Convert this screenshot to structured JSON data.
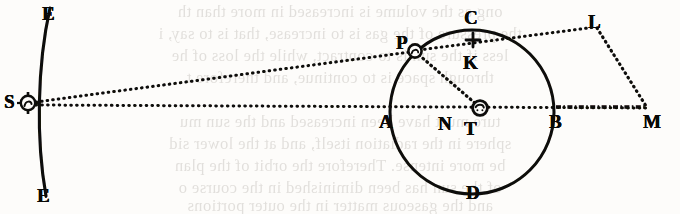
{
  "figure": {
    "kind": "geometric-astronomical-diagram",
    "caption_text": "",
    "ink_color": "#0a0907",
    "paper_color": "#fdfcfa",
    "ghost_color": "#5f564c",
    "labels": [
      {
        "id": "E-top",
        "text": "E",
        "x": 42,
        "y": 4,
        "name": "point-label-e-top"
      },
      {
        "id": "E-bot",
        "text": "E",
        "x": 37,
        "y": 186,
        "name": "point-label-e-bottom"
      },
      {
        "id": "S",
        "text": "S",
        "x": 4,
        "y": 92,
        "name": "point-label-s"
      },
      {
        "id": "P",
        "text": "P",
        "x": 396,
        "y": 33,
        "name": "point-label-p"
      },
      {
        "id": "C",
        "text": "C",
        "x": 464,
        "y": 8,
        "name": "point-label-c"
      },
      {
        "id": "K",
        "text": "K",
        "x": 463,
        "y": 53,
        "name": "point-label-k"
      },
      {
        "id": "L",
        "text": "L",
        "x": 588,
        "y": 12,
        "name": "point-label-l"
      },
      {
        "id": "A",
        "text": "A",
        "x": 379,
        "y": 112,
        "name": "point-label-a"
      },
      {
        "id": "N",
        "text": "N",
        "x": 438,
        "y": 114,
        "name": "point-label-n"
      },
      {
        "id": "T",
        "text": "T",
        "x": 464,
        "y": 119,
        "name": "point-label-t"
      },
      {
        "id": "B",
        "text": "B",
        "x": 549,
        "y": 112,
        "name": "point-label-b"
      },
      {
        "id": "D",
        "text": "D",
        "x": 466,
        "y": 183,
        "name": "point-label-d"
      },
      {
        "id": "M",
        "text": "M",
        "x": 643,
        "y": 112,
        "name": "point-label-m"
      }
    ],
    "markers": [
      {
        "id": "S-sun",
        "symbol": "sun",
        "x": 28,
        "y": 103,
        "r": 7.5,
        "name": "sun-symbol-at-s"
      },
      {
        "id": "T-earth",
        "symbol": "earth",
        "x": 480,
        "y": 108,
        "r": 7.5,
        "name": "earth-symbol-at-t"
      },
      {
        "id": "P-body",
        "symbol": "orb",
        "x": 415,
        "y": 51,
        "r": 6.5,
        "name": "planet-marker-at-p"
      },
      {
        "id": "K-cross",
        "symbol": "cross",
        "x": 473,
        "y": 40,
        "r": 6.0,
        "name": "cross-marker-at-k"
      },
      {
        "id": "N-tick",
        "symbol": "tick",
        "x": 449,
        "y": 104,
        "r": 5.0,
        "name": "tick-marker-at-n"
      }
    ],
    "geometry": {
      "circle": {
        "cx": 472,
        "cy": 112,
        "r": 82,
        "name": "main-circle-acbd"
      },
      "ee_arc": {
        "x1": 50,
        "y1": 8,
        "x2": 46,
        "y2": 196,
        "bulge": -13,
        "name": "arc-ee"
      }
    },
    "lines": [
      {
        "id": "S-P",
        "from": "S",
        "to": "P",
        "style": "dotted",
        "name": "dotted-line-s-to-p"
      },
      {
        "id": "S-M",
        "from": "S",
        "to": "M",
        "style": "dotted",
        "name": "dotted-line-s-to-m"
      },
      {
        "id": "P-K-L",
        "from": "P",
        "to": "L",
        "style": "dotted",
        "name": "dotted-line-p-through-k-to-l"
      },
      {
        "id": "L-M",
        "from": "L",
        "to": "M",
        "style": "dotted",
        "name": "dotted-line-l-to-m"
      },
      {
        "id": "P-T",
        "from": "P",
        "to": "T",
        "style": "dotted",
        "name": "dotted-line-p-to-t"
      },
      {
        "id": "B-M",
        "from": "B",
        "to": "M",
        "style": "dashed-heavy",
        "name": "dashed-line-b-to-m"
      }
    ]
  },
  "bleed_through": {
    "note": "faint mirrored text showing through from the reverse page",
    "lines": [
      {
        "text": "ong as the volume is increased in more than th",
        "y": 2
      },
      {
        "text": "the pressure of the gas is to increase, that is to say, i",
        "y": 24
      },
      {
        "text": "less if the sun is to contract, while the loss of he",
        "y": 46
      },
      {
        "text": "through space is to continue, and therefore t",
        "y": 68
      },
      {
        "text": "ture must have been increased and the sun mu",
        "y": 112
      },
      {
        "text": "sphere in the radiation itself, and at the lower sid",
        "y": 134
      },
      {
        "text": "be more intense. Therefore the orbit of the plan",
        "y": 156
      },
      {
        "text": "of the sun has been diminished in the course o",
        "y": 178
      },
      {
        "text": "and the gaseous matter in the outer portions",
        "y": 196
      }
    ]
  }
}
